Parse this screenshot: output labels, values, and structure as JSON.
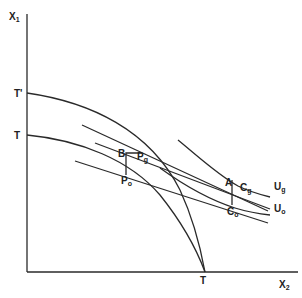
{
  "diagram": {
    "type": "production-possibility / indifference diagram",
    "axes": {
      "y_label": "X",
      "y_sub": "1",
      "x_label": "X",
      "x_sub": "2"
    },
    "labels": {
      "t_prime": "T'",
      "t_upper": "T",
      "t_axis": "T",
      "b": "B",
      "p_g": "P",
      "p_g_sub": "g",
      "p_o": "P",
      "p_o_sub": "o",
      "a": "A",
      "c_g": "C",
      "c_g_sub": "g",
      "c_o": "C",
      "c_o_sub": "o",
      "u_g": "U",
      "u_g_sub": "g",
      "u_o": "U",
      "u_o_sub": "o"
    },
    "colors": {
      "line": "#2a2a2a",
      "background": "#ffffff"
    }
  }
}
